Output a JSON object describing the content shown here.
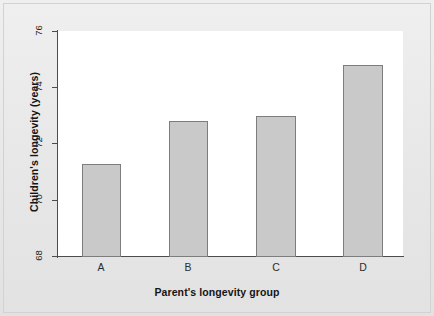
{
  "chart_data": {
    "type": "bar",
    "title": "",
    "xlabel": "Parent's longevity group",
    "ylabel": "Children's longevity (years)",
    "categories": [
      "A",
      "B",
      "C",
      "D"
    ],
    "values": [
      71.3,
      72.8,
      73.0,
      74.8
    ],
    "ylim": [
      68,
      76
    ],
    "yticks": [
      68,
      70,
      72,
      74,
      76
    ],
    "ytick_labels": [
      "68",
      "70",
      "72",
      "74",
      "76"
    ],
    "grid": false,
    "legend": null,
    "series": [
      {
        "name": "Children's longevity",
        "values": [
          71.3,
          72.8,
          73.0,
          74.8
        ]
      }
    ],
    "colors": {
      "bar_fill": "#c9c9c9",
      "bar_edge": "#7d7d7d",
      "axis": "#4c4c4c",
      "plot_background": "#ffffff",
      "figure_background": "#e9e9e9",
      "text": "#151515"
    }
  }
}
